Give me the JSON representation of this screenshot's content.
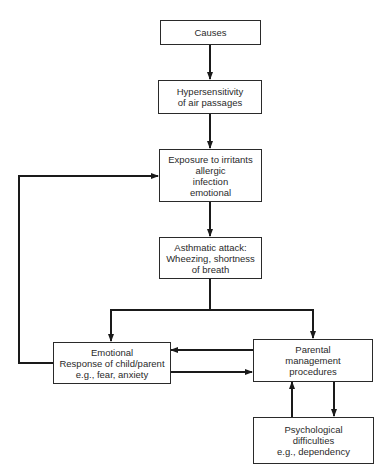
{
  "diagram": {
    "nodes": {
      "causes": {
        "lines": [
          "Causes"
        ]
      },
      "hypersensitivity": {
        "lines": [
          "Hypersensitivity",
          "of air passages"
        ]
      },
      "exposure": {
        "lines": [
          "Exposure to irritants",
          "allergic",
          "infection",
          "emotional"
        ]
      },
      "asthmatic_attack": {
        "lines": [
          "Asthmatic attack:",
          "Wheezing, shortness",
          "of breath"
        ]
      },
      "emotional_response": {
        "lines": [
          "Emotional",
          "Response of child/parent",
          "e.g., fear, anxiety"
        ]
      },
      "parental_management": {
        "lines": [
          "Parental",
          "management",
          "procedures"
        ]
      },
      "psychological_difficulties": {
        "lines": [
          "Psychological",
          "difficulties",
          "e.g., dependency"
        ]
      }
    },
    "edges": [
      {
        "from": "causes",
        "to": "hypersensitivity"
      },
      {
        "from": "hypersensitivity",
        "to": "exposure"
      },
      {
        "from": "exposure",
        "to": "asthmatic_attack"
      },
      {
        "from": "asthmatic_attack",
        "to": "emotional_response"
      },
      {
        "from": "asthmatic_attack",
        "to": "parental_management"
      },
      {
        "from": "parental_management",
        "to": "emotional_response"
      },
      {
        "from": "emotional_response",
        "to": "parental_management"
      },
      {
        "from": "emotional_response",
        "to": "exposure"
      },
      {
        "from": "parental_management",
        "to": "psychological_difficulties"
      },
      {
        "from": "psychological_difficulties",
        "to": "parental_management"
      }
    ],
    "line_color": "#1a1a1a"
  }
}
